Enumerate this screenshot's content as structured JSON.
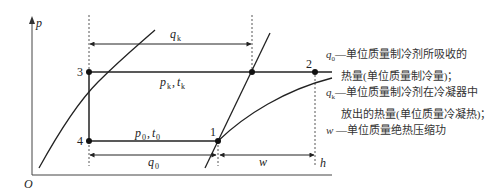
{
  "diagram": {
    "type": "p-h diagram of vapor-compression refrigeration cycle",
    "axes": {
      "y_label": "p",
      "x_label": "h",
      "origin": "O"
    },
    "points": [
      {
        "id": "1",
        "label": "1"
      },
      {
        "id": "2",
        "label": "2"
      },
      {
        "id": "3",
        "label": "3"
      },
      {
        "id": "4",
        "label": "4"
      }
    ],
    "line_labels": {
      "condensing": "p",
      "condensing_sub": "k",
      "condensing_t": "t",
      "condensing_t_sub": "k",
      "evaporating": "p",
      "evaporating_sub": "0",
      "evaporating_t": "t",
      "evaporating_t_sub": "0"
    },
    "dimension_labels": {
      "qk": "q",
      "qk_sub": "k",
      "q0": "q",
      "q0_sub": "0",
      "w": "w"
    }
  },
  "legend": {
    "items": [
      {
        "sym": "q",
        "sub": "0",
        "line1": "—单位质量制冷剂所吸收的",
        "line2": "热量(单位质量制冷量)；"
      },
      {
        "sym": "q",
        "sub": "k",
        "line1": "—单位质量制冷剂在冷凝器中",
        "line2": "放出的热量(单位质量冷凝热)；"
      },
      {
        "sym": "w",
        "sub": "",
        "line1": " —单位质量绝热压缩功",
        "line2": ""
      }
    ]
  }
}
